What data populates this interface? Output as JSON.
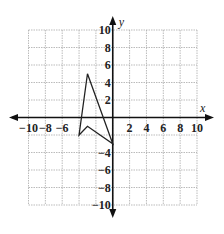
{
  "chart_data": {
    "type": "scatter",
    "subtype": "coordinate-plane-polygon",
    "title": "",
    "xlabel": "x",
    "ylabel": "y",
    "xlim": [
      -10,
      10
    ],
    "ylim": [
      -10,
      10
    ],
    "grid": true,
    "grid_step": 2,
    "x_tick_labels": [
      "-10",
      "-8",
      "-6",
      "2",
      "4",
      "6",
      "8",
      "10"
    ],
    "x_tick_values": [
      -10,
      -8,
      -6,
      2,
      4,
      6,
      8,
      10
    ],
    "y_tick_labels": [
      "10",
      "8",
      "6",
      "4",
      "2",
      "-4",
      "-6",
      "-8",
      "-10"
    ],
    "y_tick_values": [
      10,
      8,
      6,
      4,
      2,
      -4,
      -6,
      -8,
      -10
    ],
    "polygon": {
      "name": "arrowhead figure",
      "vertices": [
        [
          -3,
          5
        ],
        [
          0,
          -3
        ],
        [
          -3,
          -1
        ],
        [
          -4,
          -2
        ]
      ],
      "closed": true
    },
    "colors": {
      "grid": "#aaaaaa",
      "axes": "#111111",
      "polygon": "#222222"
    }
  }
}
